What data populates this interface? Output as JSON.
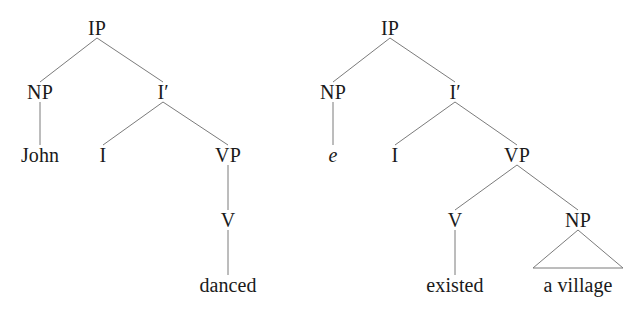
{
  "figure": {
    "background_color": "#ffffff",
    "line_color": "#7b7b7b",
    "text_color": "#1a1a1a"
  },
  "trees": [
    {
      "id": "tree-left",
      "sentence": "John danced",
      "nodes": [
        {
          "id": "l-ip",
          "label": "IP",
          "kind": "category",
          "x": 97,
          "y": 28
        },
        {
          "id": "l-np",
          "label": "NP",
          "kind": "category",
          "x": 40,
          "y": 92
        },
        {
          "id": "l-ibar",
          "label": "I′",
          "kind": "category",
          "x": 163,
          "y": 92
        },
        {
          "id": "l-john",
          "label": "John",
          "kind": "terminal",
          "x": 40,
          "y": 155
        },
        {
          "id": "l-i",
          "label": "I",
          "kind": "category",
          "x": 103,
          "y": 155
        },
        {
          "id": "l-vp",
          "label": "VP",
          "kind": "category",
          "x": 228,
          "y": 155
        },
        {
          "id": "l-v",
          "label": "V",
          "kind": "category",
          "x": 228,
          "y": 220
        },
        {
          "id": "l-danced",
          "label": "danced",
          "kind": "terminal",
          "x": 228,
          "y": 285
        }
      ],
      "edges": [
        {
          "from": "l-ip",
          "to": "l-np"
        },
        {
          "from": "l-ip",
          "to": "l-ibar"
        },
        {
          "from": "l-np",
          "to": "l-john"
        },
        {
          "from": "l-ibar",
          "to": "l-i"
        },
        {
          "from": "l-ibar",
          "to": "l-vp"
        },
        {
          "from": "l-vp",
          "to": "l-v"
        },
        {
          "from": "l-v",
          "to": "l-danced"
        }
      ],
      "triangles": []
    },
    {
      "id": "tree-right",
      "sentence": "e existed a village",
      "nodes": [
        {
          "id": "r-ip",
          "label": "IP",
          "kind": "category",
          "x": 390,
          "y": 28
        },
        {
          "id": "r-np",
          "label": "NP",
          "kind": "category",
          "x": 333,
          "y": 92
        },
        {
          "id": "r-ibar",
          "label": "I′",
          "kind": "category",
          "x": 455,
          "y": 92
        },
        {
          "id": "r-e",
          "label": "e",
          "kind": "empty",
          "x": 333,
          "y": 155
        },
        {
          "id": "r-i",
          "label": "I",
          "kind": "category",
          "x": 395,
          "y": 155
        },
        {
          "id": "r-vp",
          "label": "VP",
          "kind": "category",
          "x": 517,
          "y": 155
        },
        {
          "id": "r-v",
          "label": "V",
          "kind": "category",
          "x": 455,
          "y": 220
        },
        {
          "id": "r-np2",
          "label": "NP",
          "kind": "category",
          "x": 578,
          "y": 220
        },
        {
          "id": "r-existed",
          "label": "existed",
          "kind": "terminal",
          "x": 455,
          "y": 285
        },
        {
          "id": "r-village",
          "label": "a village",
          "kind": "terminal",
          "x": 578,
          "y": 285
        }
      ],
      "edges": [
        {
          "from": "r-ip",
          "to": "r-np"
        },
        {
          "from": "r-ip",
          "to": "r-ibar"
        },
        {
          "from": "r-np",
          "to": "r-e"
        },
        {
          "from": "r-ibar",
          "to": "r-i"
        },
        {
          "from": "r-ibar",
          "to": "r-vp"
        },
        {
          "from": "r-vp",
          "to": "r-v"
        },
        {
          "from": "r-vp",
          "to": "r-np2"
        },
        {
          "from": "r-v",
          "to": "r-existed"
        }
      ],
      "triangles": [
        {
          "from": "r-np2",
          "to": "r-village",
          "half_width": 45
        }
      ]
    }
  ]
}
